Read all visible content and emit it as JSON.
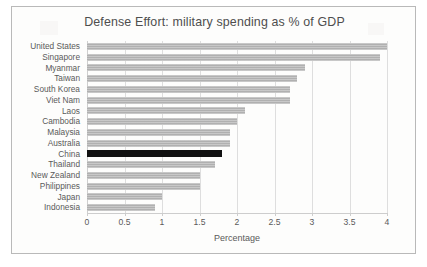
{
  "chart_data": {
    "type": "bar",
    "orientation": "horizontal",
    "title": "Defense Effort: military spending as % of GDP",
    "xlabel": "Percentage",
    "ylabel": "",
    "xlim": [
      0,
      4
    ],
    "xticks": [
      "0",
      "0.5",
      "1",
      "1.5",
      "2",
      "2.5",
      "3",
      "3.5",
      "4"
    ],
    "xtick_values": [
      0,
      0.5,
      1,
      1.5,
      2,
      2.5,
      3,
      3.5,
      4
    ],
    "grid": "vertical",
    "legend": "none",
    "categories": [
      "United States",
      "Singapore",
      "Myanmar",
      "Taiwan",
      "South Korea",
      "Viet Nam",
      "Laos",
      "Cambodia",
      "Malaysia",
      "Australia",
      "China",
      "Thailand",
      "New Zealand",
      "Philippines",
      "Japan",
      "Indonesia"
    ],
    "values": [
      4.0,
      3.9,
      2.9,
      2.8,
      2.7,
      2.7,
      2.1,
      2.0,
      1.9,
      1.9,
      1.8,
      1.7,
      1.5,
      1.5,
      1.0,
      0.9
    ],
    "highlight_category": "China",
    "colors": {
      "bar": "#b0b0b0",
      "bar_highlight": "#111111",
      "gridline": "#dedede",
      "axis": "#cdcdcd",
      "text": "#5a5a5a",
      "frame": "#b9b9b9",
      "background": "#fdfdfc"
    }
  }
}
